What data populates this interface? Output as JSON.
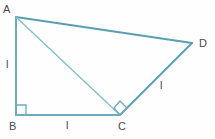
{
  "figure": {
    "kind": "geometry-diagram",
    "background_color": "#fefefe",
    "stroke_color": "#5a9fb0",
    "stroke_color_light": "#7fbfcc",
    "label_color": "#4a4a4a",
    "width": 215,
    "height": 139
  },
  "vertices": [
    {
      "id": "A",
      "label": "A",
      "x": 16,
      "y": 17,
      "label_x": 3,
      "label_y": 5
    },
    {
      "id": "B",
      "label": "B",
      "x": 16,
      "y": 115,
      "label_x": 10,
      "label_y": 122
    },
    {
      "id": "C",
      "label": "C",
      "x": 120,
      "y": 115,
      "label_x": 119,
      "label_y": 122
    },
    {
      "id": "D",
      "label": "D",
      "x": 192,
      "y": 43,
      "label_x": 199,
      "label_y": 39
    }
  ],
  "edges": [
    {
      "id": "AD",
      "from": "A",
      "to": "D",
      "style": "solid",
      "weight": 2
    },
    {
      "id": "AB",
      "from": "A",
      "to": "B",
      "style": "solid",
      "weight": 2
    },
    {
      "id": "BC",
      "from": "B",
      "to": "C",
      "style": "solid",
      "weight": 2
    },
    {
      "id": "CD",
      "from": "C",
      "to": "D",
      "style": "solid",
      "weight": 2
    },
    {
      "id": "AC",
      "from": "A",
      "to": "C",
      "style": "solid",
      "weight": 1
    }
  ],
  "side_labels": [
    {
      "id": "label-ab",
      "text": "l",
      "x": 7,
      "y": 60,
      "edge": "AB"
    },
    {
      "id": "label-bc",
      "text": "l",
      "x": 66,
      "y": 120,
      "edge": "BC"
    },
    {
      "id": "label-cd",
      "text": "l",
      "x": 160,
      "y": 81,
      "edge": "CD"
    }
  ],
  "right_angles": [
    {
      "id": "right-angle-b",
      "at": "B",
      "style": "square",
      "x": 16,
      "y": 115,
      "size": 8
    },
    {
      "id": "right-angle-c",
      "at": "C",
      "style": "diamond",
      "x": 120,
      "y": 115,
      "size": 7
    }
  ]
}
